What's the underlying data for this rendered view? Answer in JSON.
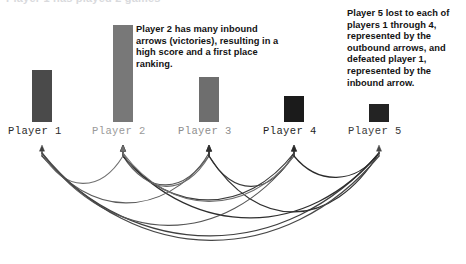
{
  "figure": {
    "clipped_top_text": "Player 1 has played 2 games",
    "background_color": "#ffffff"
  },
  "callouts": [
    {
      "id": "player2-callout",
      "text": "Player 2 has many inbound arrows (victories), resulting in a high score and a first place ranking.",
      "lines": [
        "Player 2 has many inbound",
        "arrows (victories), resulting in a",
        "high score and a first place",
        "ranking."
      ],
      "color": "#121212",
      "x": 136,
      "y": 24,
      "width": 200
    },
    {
      "id": "player5-callout",
      "text": "Player 5 lost to each of players 1 through 4, represented by the outbound arrows, and defeated player 1, represented by the inbound arrow.",
      "lines": [
        "Player 5 lost to each of",
        "players 1 through 4,",
        "represented by the",
        "outbound arrows, and",
        "defeated player 1,",
        "represented by the",
        "inbound arrow."
      ],
      "color": "#121212",
      "x": 347,
      "y": 8,
      "width": 118
    }
  ],
  "chart_data": {
    "type": "bar",
    "title": "",
    "subtitle": "",
    "xlabel": "",
    "ylabel": "",
    "grid": false,
    "legend": "none",
    "categories": [
      "Player 1",
      "Player 2",
      "Player 3",
      "Player 4",
      "Player 5"
    ],
    "values": [
      52,
      97,
      45,
      26,
      18
    ],
    "value_unit": "score (bar height in px)",
    "ylim": [
      0,
      100
    ],
    "baseline_y": 122,
    "bars": [
      {
        "label": "Player 1",
        "value": 52,
        "x": 32,
        "y": 70,
        "width": 20,
        "height": 52,
        "color": "#4a4a4a",
        "label_color": "#2b2b2b"
      },
      {
        "label": "Player 2",
        "value": 97,
        "x": 113,
        "y": 25,
        "width": 20,
        "height": 97,
        "color": "#787878",
        "label_color": "#9a9a9a"
      },
      {
        "label": "Player 3",
        "value": 45,
        "x": 199,
        "y": 77,
        "width": 20,
        "height": 45,
        "color": "#6e6e6e",
        "label_color": "#8e8e8e"
      },
      {
        "label": "Player 4",
        "value": 26,
        "x": 284,
        "y": 96,
        "width": 20,
        "height": 26,
        "color": "#1b1b1b",
        "label_color": "#1f1f1f"
      },
      {
        "label": "Player 5",
        "value": 18,
        "x": 369,
        "y": 104,
        "width": 20,
        "height": 18,
        "color": "#232323",
        "label_color": "#3a3a3a"
      }
    ],
    "labels": [
      {
        "text": "Player 1",
        "x": 8,
        "y": 126,
        "color": "#2b2b2b"
      },
      {
        "text": "Player 2",
        "x": 92,
        "y": 126,
        "color": "#9a9a9a"
      },
      {
        "text": "Player 3",
        "x": 178,
        "y": 126,
        "color": "#8e8e8e"
      },
      {
        "text": "Player 4",
        "x": 263,
        "y": 126,
        "color": "#1f1f1f"
      },
      {
        "text": "Player 5",
        "x": 348,
        "y": 126,
        "color": "#3a3a3a"
      }
    ],
    "network": {
      "description": "Directed arcs below the bars: each arc runs from the loser to the winner, arrowhead at the winner.",
      "node_x": [
        42,
        123,
        209,
        294,
        379
      ],
      "node_y": 147,
      "edges": [
        {
          "from": "Player 5",
          "to": "Player 1",
          "from_x": 379,
          "to_x": 42,
          "depth": 110,
          "color": "#3f3f3f",
          "width": 1.2
        },
        {
          "from": "Player 3",
          "to": "Player 2",
          "from_x": 209,
          "to_x": 123,
          "depth": 42,
          "color": "#555555",
          "width": 1.1
        },
        {
          "from": "Player 4",
          "to": "Player 2",
          "from_x": 294,
          "to_x": 123,
          "depth": 62,
          "color": "#3a3a3a",
          "width": 1.2
        },
        {
          "from": "Player 5",
          "to": "Player 2",
          "from_x": 379,
          "to_x": 123,
          "depth": 86,
          "color": "#2e2e2e",
          "width": 1.2
        },
        {
          "from": "Player 1",
          "to": "Player 2",
          "from_x": 42,
          "to_x": 123,
          "depth": 40,
          "color": "#707070",
          "width": 1.1
        },
        {
          "from": "Player 1",
          "to": "Player 3",
          "from_x": 42,
          "to_x": 209,
          "depth": 66,
          "color": "#5c5c5c",
          "width": 1.1
        },
        {
          "from": "Player 2",
          "to": "Player 3",
          "from_x": 123,
          "to_x": 209,
          "depth": 44,
          "color": "#6b6b6b",
          "width": 1.1
        },
        {
          "from": "Player 4",
          "to": "Player 3",
          "from_x": 294,
          "to_x": 209,
          "depth": 44,
          "color": "#3a3a3a",
          "width": 1.2
        },
        {
          "from": "Player 5",
          "to": "Player 3",
          "from_x": 379,
          "to_x": 209,
          "depth": 78,
          "color": "#303030",
          "width": 1.2
        },
        {
          "from": "Player 1",
          "to": "Player 4",
          "from_x": 42,
          "to_x": 294,
          "depth": 96,
          "color": "#555555",
          "width": 1.1
        },
        {
          "from": "Player 2",
          "to": "Player 4",
          "from_x": 123,
          "to_x": 294,
          "depth": 64,
          "color": "#6e6e6e",
          "width": 1.1
        },
        {
          "from": "Player 5",
          "to": "Player 4",
          "from_x": 379,
          "to_x": 294,
          "depth": 32,
          "color": "#2a2a2a",
          "width": 1.2
        },
        {
          "from": "Player 1",
          "to": "Player 5",
          "from_x": 42,
          "to_x": 379,
          "depth": 116,
          "color": "#474747",
          "width": 1.2
        }
      ]
    }
  }
}
